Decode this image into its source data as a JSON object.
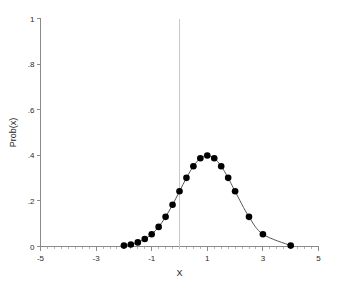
{
  "chart_data": {
    "type": "line",
    "title": "",
    "subtitle": "",
    "xlabel": "X",
    "ylabel": "Prob(x)",
    "xlim": [
      -5,
      5
    ],
    "ylim": [
      0,
      1
    ],
    "grid": false,
    "legend": null,
    "x_ticks": [
      -5,
      -3,
      -1,
      1,
      3,
      5
    ],
    "x_tick_labels": [
      "-5",
      "-3",
      "-1",
      "1",
      "3",
      "5"
    ],
    "x_minor_tick_step": 0.25,
    "y_ticks": [
      0,
      0.2,
      0.4,
      0.6,
      0.8,
      1
    ],
    "y_tick_labels": [
      "0",
      ".2",
      ".4",
      ".6",
      ".8",
      "1"
    ],
    "annotations": [
      {
        "name": "vertical-reference-line",
        "type": "vline",
        "x": 0,
        "color": "#c9c9c9"
      }
    ],
    "series": [
      {
        "name": "normal-density-mean-1-sd-1",
        "marker": "filled-circle",
        "marker_color": "#000000",
        "line_color": "#555555",
        "x": [
          -2.0,
          -1.75,
          -1.5,
          -1.25,
          -1.0,
          -0.75,
          -0.5,
          -0.25,
          0.0,
          0.25,
          0.5,
          0.75,
          1.0,
          1.25,
          1.5,
          1.75,
          2.0,
          2.5,
          3.0,
          4.0
        ],
        "y": [
          0.004,
          0.009,
          0.018,
          0.033,
          0.054,
          0.086,
          0.13,
          0.183,
          0.242,
          0.301,
          0.352,
          0.387,
          0.399,
          0.387,
          0.352,
          0.301,
          0.242,
          0.13,
          0.054,
          0.004
        ]
      }
    ]
  },
  "axis": {
    "x_title": "X",
    "y_title": "Prob(x)"
  }
}
